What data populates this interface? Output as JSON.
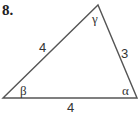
{
  "problem_number": "8.",
  "triangle": {
    "sides": {
      "left": "4",
      "right": "3",
      "bottom": "4"
    },
    "angles": {
      "top": "γ",
      "bottom_left": "β",
      "bottom_right": "α"
    },
    "stroke_color": "#555555"
  }
}
